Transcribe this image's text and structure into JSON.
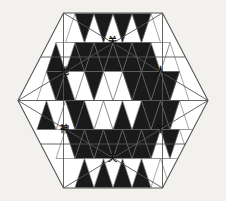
{
  "figure": {
    "background_color": "#f2f1ee",
    "fill_color": "#1a1a1a",
    "empty_color": "#ffffff",
    "line_color": "#6a6a6a",
    "outer_line_color": "#555555",
    "geometry": {
      "center_x": 113,
      "center_y": 100.5,
      "radius": 95,
      "rows": 6,
      "columns_middle": 10,
      "triangle_width": 19,
      "triangle_height": 29
    },
    "labels": [
      {
        "text": "关",
        "name": "glyph-top",
        "x": 112,
        "y": 42
      },
      {
        "text": "地",
        "name": "glyph-upper-left",
        "x": 64,
        "y": 72
      },
      {
        "text": "人",
        "name": "glyph-upper-right",
        "x": 160,
        "y": 72
      },
      {
        "text": "神",
        "name": "glyph-lower-left",
        "x": 64,
        "y": 130
      },
      {
        "text": "丫",
        "name": "glyph-lower-right",
        "x": 160,
        "y": 130
      },
      {
        "text": "天",
        "name": "glyph-bottom",
        "x": 112,
        "y": 159
      }
    ],
    "rows_fill": [
      {
        "row": 0,
        "up": [
          0,
          0,
          0,
          0,
          0
        ],
        "down": [
          1,
          1,
          1,
          1
        ]
      },
      {
        "row": 1,
        "up": [
          1,
          1,
          1,
          1,
          1,
          1,
          0
        ],
        "down": [
          0,
          1,
          1,
          1,
          1,
          0
        ]
      },
      {
        "row": 2,
        "up": [
          0,
          1,
          0,
          0,
          0,
          1,
          1,
          0
        ],
        "down": [
          1,
          0,
          1,
          0,
          1,
          1,
          1
        ]
      },
      {
        "row": 3,
        "up": [
          1,
          0,
          1,
          0,
          1,
          1,
          1,
          0
        ],
        "down": [
          0,
          1,
          0,
          0,
          0,
          1,
          1
        ]
      },
      {
        "row": 4,
        "up": [
          0,
          1,
          1,
          1,
          1,
          0
        ],
        "down": [
          1,
          1,
          1,
          1,
          1,
          1,
          0
        ]
      },
      {
        "row": 5,
        "up": [
          1,
          1,
          1,
          1
        ],
        "down": [
          0,
          0,
          0,
          0,
          0
        ]
      }
    ]
  }
}
